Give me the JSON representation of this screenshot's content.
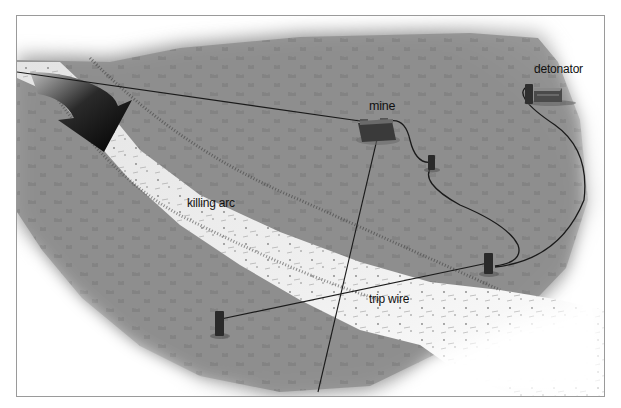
{
  "figure": {
    "labels": {
      "mine": "mine",
      "detonator": "detonator",
      "killing_arc": "killing arc",
      "trip_wire": "trip wire"
    },
    "elements": [
      {
        "name": "direction-arrow",
        "description": "large black curved arrow showing approach direction"
      },
      {
        "name": "path",
        "description": "light sandy path crossing grass field"
      },
      {
        "name": "mine",
        "description": "directional mine on stand"
      },
      {
        "name": "detonator",
        "description": "detonator box connected by firing wire"
      },
      {
        "name": "trip-wire",
        "description": "wire between two stakes across the path"
      },
      {
        "name": "stakes",
        "count": 3
      }
    ],
    "colors": {
      "grass": "#8f8f8f",
      "grass_dark": "#6e6e6e",
      "path": "#eeeeee",
      "wire": "#1a1a1a",
      "frame_border": "#9a9a9a",
      "text": "#111111"
    }
  }
}
